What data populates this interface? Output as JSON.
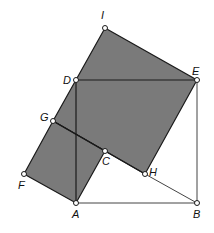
{
  "diagram": {
    "type": "geometry",
    "fill_color": "#7a7a7a",
    "stroke_color": "#1a1a1a",
    "points": {
      "I": {
        "label": "I",
        "x": 105,
        "y": 28
      },
      "D": {
        "label": "D",
        "x": 76,
        "y": 80
      },
      "E": {
        "label": "E",
        "x": 197,
        "y": 80
      },
      "G": {
        "label": "G",
        "x": 53,
        "y": 121
      },
      "C": {
        "label": "C",
        "x": 105,
        "y": 151
      },
      "H": {
        "label": "H",
        "x": 145,
        "y": 174
      },
      "F": {
        "label": "F",
        "x": 24,
        "y": 174
      },
      "A": {
        "label": "A",
        "x": 76,
        "y": 203
      },
      "B": {
        "label": "B",
        "x": 197,
        "y": 203
      }
    },
    "shaded_polygons": [
      {
        "name": "large-square",
        "vertices": [
          "I",
          "E",
          "H",
          "G"
        ]
      },
      {
        "name": "small-square",
        "vertices": [
          "G",
          "C",
          "A",
          "F"
        ]
      }
    ],
    "segments": [
      [
        "D",
        "E"
      ],
      [
        "E",
        "B"
      ],
      [
        "A",
        "B"
      ],
      [
        "A",
        "D"
      ],
      [
        "H",
        "B"
      ],
      [
        "G",
        "H"
      ]
    ]
  }
}
